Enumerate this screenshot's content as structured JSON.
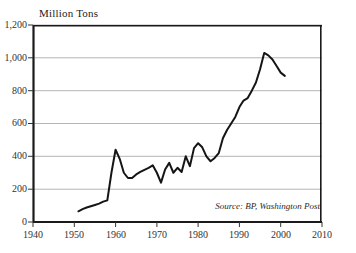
{
  "chart_data": {
    "type": "line",
    "title": "Million Tons",
    "xlabel": "",
    "ylabel": "Million Tons",
    "xlim": [
      1940,
      2010
    ],
    "ylim": [
      0,
      1200
    ],
    "grid": true,
    "legend": null,
    "source_note": "Source: BP, Washington Post",
    "yticks": [
      0,
      200,
      400,
      600,
      800,
      1000,
      1200
    ],
    "ytick_labels": [
      "0",
      "200",
      "400",
      "600",
      "800",
      "1,000",
      "1,200"
    ],
    "xticks": [
      1940,
      1950,
      1960,
      1970,
      1980,
      1990,
      2000,
      2010
    ],
    "xtick_labels": [
      "1940",
      "1950",
      "1960",
      "1970",
      "1980",
      "1990",
      "2000",
      "2010"
    ],
    "series": [
      {
        "name": "Production",
        "color": "#151515",
        "x": [
          1951,
          1952,
          1953,
          1954,
          1955,
          1956,
          1957,
          1958,
          1959,
          1960,
          1961,
          1962,
          1963,
          1964,
          1965,
          1966,
          1967,
          1968,
          1969,
          1970,
          1971,
          1972,
          1973,
          1974,
          1975,
          1976,
          1977,
          1978,
          1979,
          1980,
          1981,
          1982,
          1983,
          1984,
          1985,
          1986,
          1987,
          1988,
          1989,
          1990,
          1991,
          1992,
          1993,
          1994,
          1995,
          1996,
          1997,
          1998,
          1999,
          2000,
          2001
        ],
        "y": [
          65,
          78,
          88,
          96,
          104,
          112,
          124,
          132,
          300,
          440,
          385,
          300,
          268,
          268,
          290,
          305,
          318,
          330,
          345,
          300,
          240,
          320,
          360,
          300,
          330,
          305,
          400,
          340,
          450,
          480,
          455,
          400,
          370,
          390,
          420,
          510,
          560,
          600,
          640,
          700,
          740,
          755,
          800,
          850,
          930,
          1030,
          1015,
          990,
          950,
          910,
          890
        ]
      }
    ]
  },
  "axis": {
    "x_label_1940": "1940",
    "x_label_1950": "1950",
    "x_label_1960": "1960",
    "x_label_1970": "1970",
    "x_label_1980": "1980",
    "x_label_1990": "1990",
    "x_label_2000": "2000",
    "x_label_2010": "2010",
    "y_label_0": "0",
    "y_label_200": "200",
    "y_label_400": "400",
    "y_label_600": "600",
    "y_label_800": "800",
    "y_label_1000": "1,000",
    "y_label_1200": "1,200"
  },
  "colors": {
    "line": "#151515",
    "frame": "#1a1a1a",
    "grid": "#b5b5b5",
    "background": "#ffffff",
    "text": "#333333"
  }
}
